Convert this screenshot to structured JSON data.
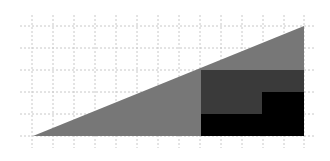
{
  "canvas": {
    "width": 330,
    "height": 161,
    "background": "#ffffff"
  },
  "grid": {
    "color": "#c8c8c8",
    "dash": "2,2",
    "vertical_x": [
      32,
      53,
      74,
      95,
      116,
      137,
      158,
      179,
      200,
      221,
      242,
      263,
      284,
      304
    ],
    "vertical_y_range": [
      15,
      148
    ],
    "horizontal_y": [
      26,
      48,
      70,
      92,
      114,
      136
    ],
    "horizontal_x_range": [
      20,
      316
    ]
  },
  "shapes": {
    "triangle": {
      "points": "33,136 304,26 304,136",
      "fill": "#777777"
    },
    "dark_rect": {
      "x": 201,
      "y": 70,
      "width": 103,
      "height": 66,
      "fill": "#3a3a3a"
    },
    "black_staircase": {
      "points": "201,114 262,114 262,92 304,92 304,136 201,136",
      "fill": "#000000"
    }
  }
}
